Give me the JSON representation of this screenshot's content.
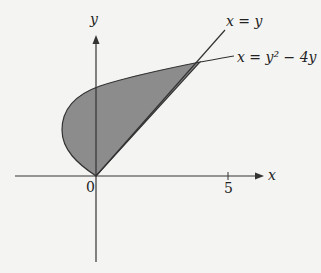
{
  "figure": {
    "axes": {
      "x_label": "x",
      "y_label": "y",
      "origin_label": "0",
      "x_tick_label": "5"
    },
    "curves": [
      {
        "name": "line",
        "label": "x = y"
      },
      {
        "name": "parabola",
        "label": "x = y² − 4y"
      }
    ],
    "shaded_region": "Region between x = y² − 4y and x = y for 0 ≤ y ≤ 5",
    "colors": {
      "fill": "#8c8c8c",
      "stroke": "#333333",
      "background": "#f4f4f2"
    }
  }
}
